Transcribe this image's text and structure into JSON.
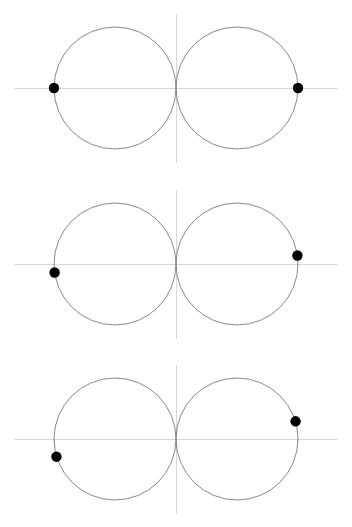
{
  "figure": {
    "width": 352,
    "height": 527,
    "background_color": "#ffffff",
    "axis_color": "#d8d8d8",
    "curve_color": "#7a7a7a",
    "marker_color": "#000000",
    "panel_count": 3
  },
  "chart_data": {
    "type": "scatter",
    "title": "",
    "subtitle": "",
    "xlabel": "",
    "ylabel": "",
    "grid": false,
    "legend": null,
    "legend_position": "none",
    "xlim": [
      -2.7,
      2.7
    ],
    "ylim": [
      -1.35,
      1.35
    ],
    "tick_labels_x": [],
    "tick_labels_y": [],
    "annotations": [],
    "panels": [
      {
        "index": 1,
        "label": "panel-1",
        "axes": {
          "x_axis_y": 0,
          "y_axis_x": 0
        },
        "circles": [
          {
            "name": "left-circle",
            "cx": -1.0,
            "cy": 0.0,
            "r": 1.0
          },
          {
            "name": "right-circle",
            "cx": 1.0,
            "cy": 0.0,
            "r": 1.0
          }
        ],
        "intersections": [
          {
            "x": 0.0,
            "y": 1.0
          },
          {
            "x": 0.0,
            "y": -1.0
          }
        ],
        "markers": [
          {
            "name": "left-marker",
            "x": -2.0,
            "y": 0.0,
            "angle_deg": 180,
            "on_circle": "left-circle"
          },
          {
            "name": "right-marker",
            "x": 2.0,
            "y": 0.0,
            "angle_deg": 0,
            "on_circle": "right-circle"
          }
        ]
      },
      {
        "index": 2,
        "label": "panel-2",
        "axes": {
          "x_axis_y": 0,
          "y_axis_x": 0
        },
        "circles": [
          {
            "name": "left-circle",
            "cx": -1.0,
            "cy": 0.0,
            "r": 1.0
          },
          {
            "name": "right-circle",
            "cx": 1.0,
            "cy": 0.0,
            "r": 1.0
          }
        ],
        "intersections": [
          {
            "x": 0.0,
            "y": 1.0
          },
          {
            "x": 0.0,
            "y": -1.0
          }
        ],
        "markers": [
          {
            "name": "left-marker",
            "x": -1.99,
            "y": -0.14,
            "angle_deg": 188,
            "on_circle": "left-circle"
          },
          {
            "name": "right-marker",
            "x": 1.99,
            "y": 0.14,
            "angle_deg": 8,
            "on_circle": "right-circle"
          }
        ]
      },
      {
        "index": 3,
        "label": "panel-3",
        "axes": {
          "x_axis_y": 0,
          "y_axis_x": 0
        },
        "circles": [
          {
            "name": "left-circle",
            "cx": -1.0,
            "cy": 0.0,
            "r": 1.0
          },
          {
            "name": "right-circle",
            "cx": 1.0,
            "cy": 0.0,
            "r": 1.0
          }
        ],
        "intersections": [
          {
            "x": 0.0,
            "y": 1.0
          },
          {
            "x": 0.0,
            "y": -1.0
          }
        ],
        "markers": [
          {
            "name": "left-marker",
            "x": -1.96,
            "y": -0.29,
            "angle_deg": 197,
            "on_circle": "left-circle"
          },
          {
            "name": "right-marker",
            "x": 1.96,
            "y": 0.29,
            "angle_deg": 17,
            "on_circle": "right-circle"
          }
        ]
      }
    ]
  },
  "render": {
    "panel_tops": [
      0,
      176,
      351
    ],
    "panel_height": 176,
    "origin_x": 176,
    "origin_y": 88,
    "scale": 61,
    "marker_radius_px": 5.2,
    "x_axis_start_px": 14,
    "x_axis_end_px": 338,
    "y_axis_start_px": 14,
    "y_axis_end_px": 163
  }
}
